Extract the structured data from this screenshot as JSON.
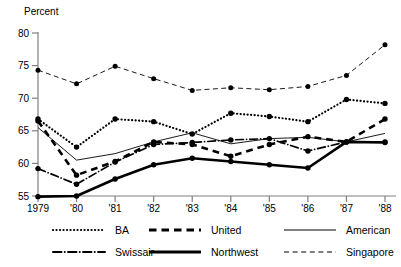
{
  "chart_data": {
    "type": "line",
    "title": "",
    "xlabel": "",
    "ylabel": "Percent",
    "ylim": [
      55,
      80
    ],
    "yticks": [
      55,
      60,
      65,
      70,
      75,
      80
    ],
    "ytick_labels": [
      "55",
      "60",
      "65",
      "70",
      "75",
      "80"
    ],
    "grid": false,
    "legend_position": "below",
    "x": [
      1979,
      1980,
      1981,
      1982,
      1983,
      1984,
      1985,
      1986,
      1987,
      1988
    ],
    "categories": [
      "1979",
      "'80",
      "'81",
      "'82",
      "'83",
      "'84",
      "'85",
      "'86",
      "'87",
      "'88"
    ],
    "series": [
      {
        "name": "BA",
        "style": "dotted",
        "width": 2.2,
        "marker": "circle",
        "values": [
          66.8,
          62.5,
          66.8,
          66.4,
          64.5,
          67.7,
          67.2,
          66.4,
          69.8,
          69.2
        ]
      },
      {
        "name": "Swissair",
        "style": "dash-dot",
        "width": 1.7,
        "marker": "circle",
        "values": [
          59.2,
          56.8,
          60.2,
          62.9,
          63.2,
          63.6,
          63.8,
          61.9,
          63.3,
          63.3
        ]
      },
      {
        "name": "United",
        "style": "dashed",
        "width": 2.6,
        "marker": "circle",
        "values": [
          66.5,
          58.2,
          60.3,
          63.3,
          62.9,
          61.1,
          62.9,
          64.1,
          63.3,
          66.8
        ]
      },
      {
        "name": "Northwest",
        "style": "solid",
        "width": 2.6,
        "marker": "circle",
        "values": [
          54.9,
          55.0,
          57.6,
          59.8,
          60.8,
          60.3,
          59.8,
          59.3,
          63.3,
          63.2
        ]
      },
      {
        "name": "American",
        "style": "solid",
        "width": 0.9,
        "marker": "none",
        "values": [
          65.5,
          60.5,
          61.5,
          63.3,
          64.7,
          63.0,
          63.8,
          64.0,
          63.3,
          64.6
        ]
      },
      {
        "name": "Singapore",
        "style": "dashed",
        "width": 0.9,
        "marker": "circle",
        "values": [
          74.3,
          72.2,
          74.9,
          73.0,
          71.2,
          71.6,
          71.3,
          71.8,
          73.5,
          78.2
        ]
      }
    ]
  },
  "axis": {
    "ylabel": "Percent",
    "ytick_labels": [
      "80",
      "75",
      "70",
      "65",
      "60",
      "55"
    ],
    "xtick_labels": [
      "1979",
      "'80",
      "'81",
      "'82",
      "'83",
      "'84",
      "'85",
      "'86",
      "'87",
      "'88"
    ]
  },
  "legend": {
    "rows": [
      [
        {
          "label": "BA",
          "style": "dotted"
        },
        {
          "label": "United",
          "style": "dashed-thick"
        },
        {
          "label": "American",
          "style": "solid-thin"
        }
      ],
      [
        {
          "label": "Swissair",
          "style": "dash-dot"
        },
        {
          "label": "Northwest",
          "style": "solid-thick"
        },
        {
          "label": "Singapore",
          "style": "dashed-thin"
        }
      ]
    ]
  },
  "colors": {
    "line": "#000000",
    "axis": "#808080",
    "background": "#ffffff"
  }
}
